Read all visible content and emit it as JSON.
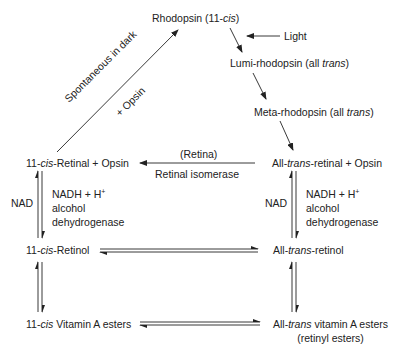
{
  "nodes": {
    "rhodopsin": {
      "pre": "Rhodopsin (11-",
      "it": "cis",
      "post": ")"
    },
    "lumi": {
      "pre": "Lumi-rhodopsin (all ",
      "it": "trans",
      "post": ")"
    },
    "meta": {
      "pre": "Meta-rhodopsin (all ",
      "it": "trans",
      "post": ")"
    },
    "cis_retinal": {
      "pre": "11-",
      "it": "cis",
      "post": "-Retinal  +  Opsin"
    },
    "trans_retinal": {
      "pre": "All-",
      "it": "trans",
      "post": "-retinal  +  Opsin"
    },
    "cis_retinol": {
      "pre": "11-",
      "it": "cis",
      "post": "-Retinol"
    },
    "trans_retinol": {
      "pre": "All-",
      "it": "trans",
      "post": "-retinol"
    },
    "cis_esters": {
      "pre": "11-",
      "it": "cis",
      "post": " Vitamin A esters"
    },
    "trans_esters": {
      "pre": "All-",
      "it": "trans",
      "post": " vitamin A esters",
      "line2": "(retinyl esters)"
    }
  },
  "labels": {
    "light": "Light",
    "spontaneous": "Spontaneous in dark",
    "plus_opsin": "+ Opsin",
    "retina": "(Retina)",
    "isomerase": "Retinal isomerase",
    "nad_left": "NAD",
    "nad_right": "NAD",
    "nadh_left": "NADH + H",
    "nadh_right": "NADH + H",
    "plus_sup": "+",
    "alcohol_left": "alcohol",
    "alcohol_right": "alcohol",
    "dehydro_left": "dehydrogenase",
    "dehydro_right": "dehydrogenase"
  }
}
